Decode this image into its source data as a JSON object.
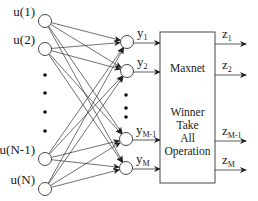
{
  "diagram": {
    "inputs": [
      {
        "label": "u(1)",
        "x": 45,
        "y": 21
      },
      {
        "label": "u(2)",
        "x": 45,
        "y": 49
      },
      {
        "label": "u(N-1)",
        "x": 45,
        "y": 159
      },
      {
        "label": "u(N)",
        "x": 45,
        "y": 189
      }
    ],
    "input_ellipsis_dots": [
      [
        45,
        75
      ],
      [
        45,
        93
      ],
      [
        45,
        112
      ],
      [
        45,
        131
      ]
    ],
    "hidden": [
      {
        "label": "y",
        "sub": "1",
        "x": 127,
        "y": 42
      },
      {
        "label": "y",
        "sub": "2",
        "x": 127,
        "y": 71
      },
      {
        "label": "y",
        "sub": "M-1",
        "x": 126,
        "y": 139
      },
      {
        "label": "y",
        "sub": "M",
        "x": 126,
        "y": 168
      }
    ],
    "hidden_ellipsis_dots": [
      [
        126,
        95
      ],
      [
        126,
        108
      ],
      [
        126,
        117
      ]
    ],
    "box": {
      "x": 160,
      "y": 32,
      "w": 55,
      "h": 151,
      "title": "Maxnet",
      "lines": [
        "Winner",
        "Take",
        "All",
        "Operation"
      ]
    },
    "outputs": [
      {
        "label": "z",
        "sub": "1",
        "y": 44
      },
      {
        "label": "z",
        "sub": "2",
        "y": 75
      },
      {
        "label": "z",
        "sub": "M-1",
        "y": 141
      },
      {
        "label": "z",
        "sub": "M",
        "y": 170
      }
    ],
    "colors": {
      "stroke": "#333333",
      "text": "#1a1a1a",
      "background": "#ffffff"
    }
  }
}
